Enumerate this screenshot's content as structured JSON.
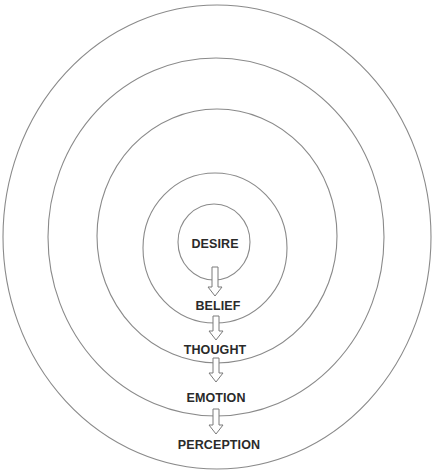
{
  "diagram": {
    "title": "",
    "stroke_color": "#8a8a8a",
    "text_color": "#2a2a2a",
    "rings": [
      {
        "name": "ring-perception",
        "cx": 217,
        "cy": 237,
        "rx": 214,
        "ry": 232
      },
      {
        "name": "ring-emotion",
        "cx": 216,
        "cy": 237,
        "rx": 168,
        "ry": 179
      },
      {
        "name": "ring-thought",
        "cx": 217,
        "cy": 236,
        "rx": 120,
        "ry": 127
      },
      {
        "name": "ring-belief",
        "cx": 215,
        "cy": 248,
        "rx": 72,
        "ry": 75
      },
      {
        "name": "ring-desire",
        "cx": 214,
        "cy": 242,
        "rx": 36,
        "ry": 38
      }
    ],
    "labels": [
      {
        "text": "DESIRE",
        "x": 215,
        "y": 244
      },
      {
        "text": "BELIEF",
        "x": 218,
        "y": 306
      },
      {
        "text": "THOUGHT",
        "x": 215,
        "y": 350
      },
      {
        "text": "EMOTION",
        "x": 216,
        "y": 398
      },
      {
        "text": "PERCEPTION",
        "x": 219,
        "y": 445
      }
    ],
    "arrows": [
      {
        "from": "DESIRE",
        "to": "BELIEF",
        "x": 215,
        "y1": 267,
        "y2": 296
      },
      {
        "from": "BELIEF",
        "to": "THOUGHT",
        "x": 216,
        "y1": 316,
        "y2": 340
      },
      {
        "from": "THOUGHT",
        "to": "EMOTION",
        "x": 216,
        "y1": 358,
        "y2": 382
      },
      {
        "from": "EMOTION",
        "to": "PERCEPTION",
        "x": 216,
        "y1": 409,
        "y2": 434
      }
    ]
  }
}
